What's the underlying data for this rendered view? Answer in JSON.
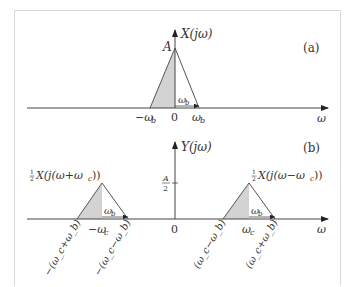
{
  "panel_a": {
    "tag": "(a)",
    "y_axis_label": "X(jω)",
    "peak_label": "A",
    "x_axis_label": "ω",
    "ticks": [
      "−ω_b",
      "0",
      "ω_b"
    ],
    "tick_text": {
      "neg": "−ω",
      "neg_sub": "b",
      "zero": "0",
      "pos": "ω",
      "pos_sub": "b"
    },
    "width_label": {
      "main": "ω",
      "sub": "b"
    }
  },
  "panel_b": {
    "tag": "(b)",
    "y_axis_label": "Y(jω)",
    "half_height_label": {
      "num": "A",
      "den": "2"
    },
    "x_axis_label": "ω",
    "left_copy_label": "X(j(ω+ω_c))",
    "right_copy_label": "X(j(ω−ω_c))",
    "copy_coef": {
      "num": "1",
      "den": "2"
    },
    "left_copy_text": "X(j(ω+ω",
    "right_copy_text": "X(j(ω−ω",
    "copy_sub": "c",
    "copy_close": "))",
    "center_tick": "0",
    "neg_center": {
      "main": "−ω",
      "sub": "c"
    },
    "pos_center": {
      "main": "ω",
      "sub": "c"
    },
    "rotated_ticks": [
      "−(ω_c+ω_b)",
      "−(ω_c−ω_b)",
      "(ω_c−ω_b)",
      "(ω_c+ω_b)"
    ],
    "width_label": {
      "main": "ω",
      "sub": "b"
    }
  },
  "colors": {
    "fill": "#d3d3d3",
    "line": "#555555",
    "frame": "#d8d8d8"
  }
}
